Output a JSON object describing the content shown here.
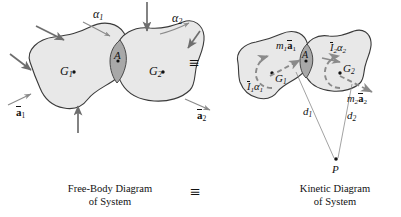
{
  "figure": {
    "domain": "diagram-mechanics",
    "equivalence_symbol": "≡",
    "background_color": "#ffffff",
    "body_fill_color": "#e8e8e8",
    "overlap_fill_color": "#a8a8a8",
    "outline_color": "#3a3a3a",
    "force_arrow_color": "#6e6e6e",
    "dashed_vector_color": "#8a8a8a",
    "leader_line_color": "#8a8a8a",
    "text_color": "#111111"
  },
  "free_body_diagram": {
    "caption_line1": "Free-Body Diagram",
    "caption_line2": "of System",
    "body1_label": "G",
    "body1_sub": "1",
    "body2_label": "G",
    "body2_sub": "2",
    "contact_point_label": "A",
    "alpha1": "α",
    "alpha1_sub": "1",
    "alpha2": "α",
    "alpha2_sub": "2",
    "accel1_symbol": "a",
    "accel1_sub": "1",
    "accel2_symbol": "a",
    "accel2_sub": "2",
    "external_force_count": 5
  },
  "kinetic_diagram": {
    "caption_line1": "Kinetic Diagram",
    "caption_line2": "of System",
    "body1_label": "G",
    "body1_sub": "1",
    "body2_label": "G",
    "body2_sub": "2",
    "contact_point_label": "A",
    "moment1_I": "I",
    "moment1_alpha": "α",
    "moment1_sub": "1",
    "moment2_I": "I",
    "moment2_alpha": "α",
    "moment2_sub": "2",
    "force1_m": "m",
    "force1_sub": "1",
    "force1_a": "a",
    "force2_m": "m",
    "force2_sub": "2",
    "force2_a": "a",
    "distance1": "d",
    "distance1_sub": "1",
    "distance2": "d",
    "distance2_sub": "2",
    "reference_point": "P"
  },
  "center_equiv": "≡",
  "caption_equiv": "≡"
}
